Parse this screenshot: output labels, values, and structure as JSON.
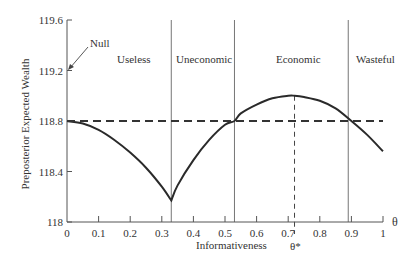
{
  "chart_data": {
    "type": "line",
    "title": "",
    "xlabel": "Informativeness",
    "ylabel": "Preposterior Expected Wealth",
    "x_axis_symbol": "θ",
    "xlim": [
      0,
      1
    ],
    "ylim": [
      118,
      119.6
    ],
    "xticks": [
      "0",
      "0.1",
      "0.2",
      "0.3",
      "0.4",
      "0.5",
      "0.6",
      "0.7",
      "0.8",
      "0.9",
      "1"
    ],
    "yticks": [
      "118",
      "118.4",
      "118.8",
      "119.2",
      "119.6"
    ],
    "grid": false,
    "series": [
      {
        "name": "Preposterior expected wealth",
        "style": "solid",
        "x": [
          0,
          0.05,
          0.1,
          0.15,
          0.2,
          0.25,
          0.3,
          0.33,
          0.35,
          0.4,
          0.45,
          0.5,
          0.53,
          0.55,
          0.6,
          0.65,
          0.7,
          0.72,
          0.75,
          0.8,
          0.85,
          0.9,
          0.95,
          1.0
        ],
        "y": [
          118.8,
          118.78,
          118.73,
          118.65,
          118.55,
          118.43,
          118.28,
          118.17,
          118.29,
          118.49,
          118.65,
          118.77,
          118.8,
          118.86,
          118.93,
          118.98,
          119.0,
          119.0,
          118.99,
          118.96,
          118.9,
          118.8,
          118.69,
          118.56
        ]
      },
      {
        "name": "Null (no information) wealth",
        "style": "dashed",
        "x": [
          0,
          1
        ],
        "y": [
          118.8,
          118.8
        ]
      }
    ],
    "vertical_lines": [
      {
        "x": 0.33,
        "style": "solid"
      },
      {
        "x": 0.53,
        "style": "solid"
      },
      {
        "x": 0.89,
        "style": "solid"
      },
      {
        "x": 0.72,
        "style": "dashed",
        "label": "θ*"
      }
    ],
    "regions": [
      {
        "label": "Useless",
        "from": 0,
        "to": 0.33
      },
      {
        "label": "Uneconomic",
        "from": 0.33,
        "to": 0.53
      },
      {
        "label": "Economic",
        "from": 0.53,
        "to": 0.89
      },
      {
        "label": "Wasteful",
        "from": 0.89,
        "to": 1.0
      }
    ],
    "annotations": [
      {
        "text": "Null",
        "points_to": [
          0,
          119.2
        ]
      },
      {
        "text": "θ*",
        "x": 0.72
      }
    ]
  },
  "labels": {
    "null": "Null",
    "useless": "Useless",
    "uneconomic": "Uneconomic",
    "economic": "Economic",
    "wasteful": "Wasteful",
    "theta_star": "θ*",
    "theta": "θ",
    "xlabel": "Informativeness",
    "ylabel": "Preposterior Expected Wealth"
  }
}
